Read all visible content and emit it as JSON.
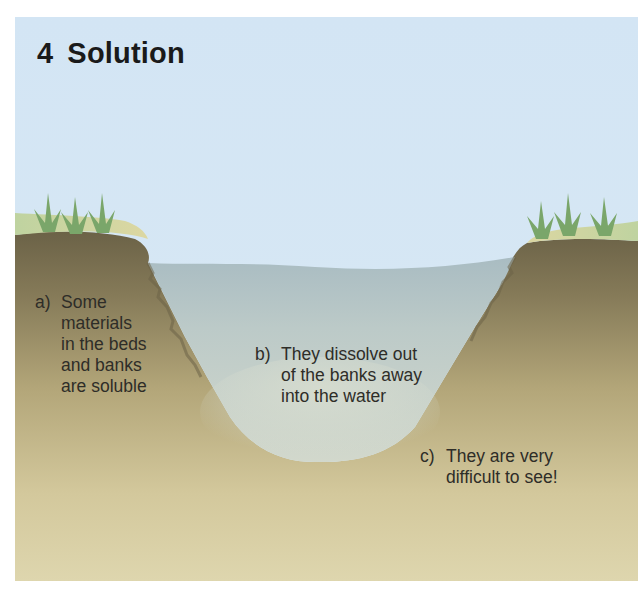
{
  "diagram": {
    "title_number": "4",
    "title_text": "Solution",
    "labels": [
      {
        "letter": "a)",
        "text": "Some\nmaterials\nin the beds\nand banks\nare soluble"
      },
      {
        "letter": "b)",
        "text": "They dissolve out\nof the banks away\ninto the water"
      },
      {
        "letter": "c)",
        "text": "They are very\ndifficult to see!"
      }
    ],
    "colors": {
      "sky": "#d5e6f4",
      "water_surface": "#aebfc3",
      "water_deep": "#c9d3cc",
      "bank_top_dark": "#6e6448",
      "bank_mid": "#a89a6e",
      "bank_bottom": "#dcd2a6",
      "grass": "#7aa66a",
      "grass_bank": "#c8d7a5",
      "title_text": "#1a1a1a",
      "label_text": "#2e2d28"
    }
  }
}
